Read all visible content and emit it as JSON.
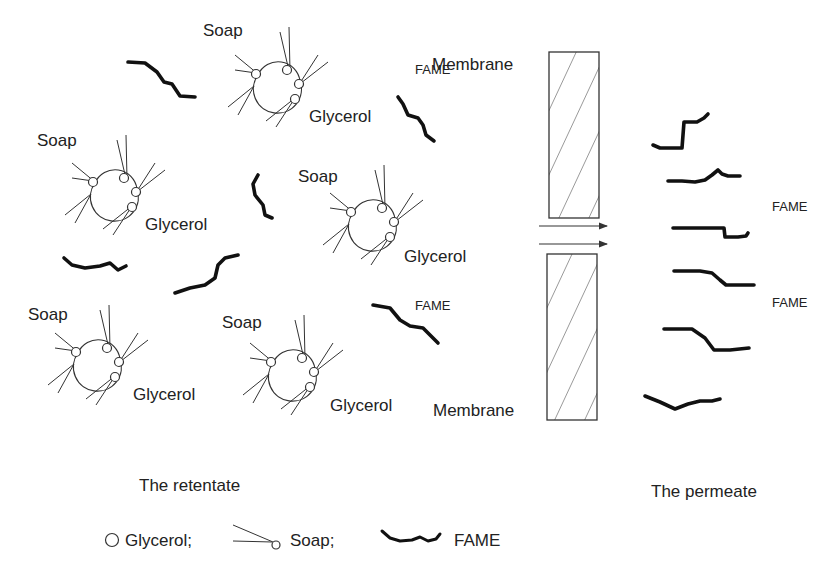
{
  "diagram": {
    "type": "membrane-separation-schematic",
    "retentate_side": {
      "clusters": [
        {
          "soap_label": "Soap",
          "glycerol_label": "Glycerol",
          "x": 300,
          "y": 105
        },
        {
          "soap_label": "Soap",
          "glycerol_label": "Glycerol",
          "x": 100,
          "y": 210
        },
        {
          "soap_label": "Soap",
          "glycerol_label": "Glycerol",
          "x": 360,
          "y": 225
        },
        {
          "soap_label": "Soap",
          "glycerol_label": "Glycerol",
          "x": 85,
          "y": 360
        },
        {
          "soap_label": "Soap",
          "glycerol_label": "Glycerol",
          "x": 280,
          "y": 370
        }
      ],
      "fame_labels": [
        "FAME",
        "FAME"
      ],
      "caption": "The retentate"
    },
    "membrane": {
      "top_label": "Membrane",
      "bottom_label": "Membrane",
      "arrows": 2
    },
    "permeate_side": {
      "fame_labels": [
        "FAME",
        "FAME"
      ],
      "caption": "The permeate"
    },
    "legend": {
      "items": [
        {
          "icon": "glycerol-circle-icon",
          "label": "Glycerol;"
        },
        {
          "icon": "soap-molecule-icon",
          "label": "Soap;"
        },
        {
          "icon": "fame-chain-icon",
          "label": "FAME"
        }
      ]
    }
  }
}
